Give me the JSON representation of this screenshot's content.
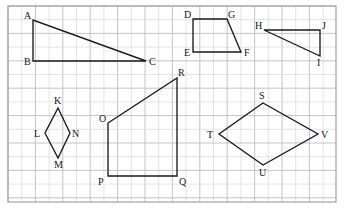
{
  "worksheet": {
    "title": "Geometry grid worksheet with six labeled polygons",
    "background_color": "#ffffff",
    "grid": {
      "minor_color": "#d8d8de",
      "major_color": "#bcbcc6",
      "cell_size": 13.7,
      "major_every": 2,
      "frame_color": "#9a9aa6",
      "frame": {
        "x": 8,
        "y": 6,
        "width": 328,
        "height": 196
      }
    },
    "ink_color": "#1a1a1a",
    "shapes": [
      {
        "id": "triangle-abc",
        "name": "right triangle ABC",
        "closed": true,
        "points": [
          {
            "label": "A",
            "x": 33,
            "y": 20,
            "lx": 24,
            "ly": 19
          },
          {
            "label": "B",
            "x": 33,
            "y": 61,
            "lx": 24,
            "ly": 65
          },
          {
            "label": "C",
            "x": 146,
            "y": 61,
            "lx": 149,
            "ly": 65
          }
        ]
      },
      {
        "id": "quad-defg",
        "name": "trapezoid D E F G",
        "closed": true,
        "points": [
          {
            "label": "D",
            "x": 193,
            "y": 19,
            "lx": 184,
            "ly": 18
          },
          {
            "label": "G",
            "x": 227,
            "y": 19,
            "lx": 228,
            "ly": 18
          },
          {
            "label": "F",
            "x": 241,
            "y": 52,
            "lx": 244,
            "ly": 56
          },
          {
            "label": "E",
            "x": 193,
            "y": 52,
            "lx": 184,
            "ly": 56
          }
        ]
      },
      {
        "id": "triangle-hij",
        "name": "right triangle HIJ",
        "closed": true,
        "points": [
          {
            "label": "H",
            "x": 264,
            "y": 30,
            "lx": 255,
            "ly": 29
          },
          {
            "label": "J",
            "x": 320,
            "y": 30,
            "lx": 322,
            "ly": 29
          },
          {
            "label": "I",
            "x": 320,
            "y": 56,
            "lx": 317,
            "ly": 66
          }
        ]
      },
      {
        "id": "rhombus-klmn",
        "name": "small rhombus K L M N",
        "closed": true,
        "points": [
          {
            "label": "K",
            "x": 58,
            "y": 108,
            "lx": 54,
            "ly": 104
          },
          {
            "label": "N",
            "x": 70,
            "y": 133,
            "lx": 72,
            "ly": 137
          },
          {
            "label": "M",
            "x": 58,
            "y": 158,
            "lx": 54,
            "ly": 168
          },
          {
            "label": "L",
            "x": 45,
            "y": 133,
            "lx": 34,
            "ly": 137
          }
        ]
      },
      {
        "id": "quad-opqr",
        "name": "trapezoid O P Q R",
        "closed": true,
        "points": [
          {
            "label": "O",
            "x": 108,
            "y": 123,
            "lx": 99,
            "ly": 122
          },
          {
            "label": "R",
            "x": 177,
            "y": 78,
            "lx": 178,
            "ly": 76
          },
          {
            "label": "Q",
            "x": 177,
            "y": 176,
            "lx": 179,
            "ly": 185
          },
          {
            "label": "P",
            "x": 108,
            "y": 176,
            "lx": 98,
            "ly": 185
          }
        ]
      },
      {
        "id": "rhombus-stuv",
        "name": "large rhombus S T U V",
        "closed": true,
        "points": [
          {
            "label": "S",
            "x": 263,
            "y": 103,
            "lx": 259,
            "ly": 99
          },
          {
            "label": "V",
            "x": 318,
            "y": 134,
            "lx": 321,
            "ly": 138
          },
          {
            "label": "U",
            "x": 263,
            "y": 165,
            "lx": 259,
            "ly": 176
          },
          {
            "label": "T",
            "x": 219,
            "y": 134,
            "lx": 207,
            "ly": 138
          }
        ]
      }
    ]
  }
}
